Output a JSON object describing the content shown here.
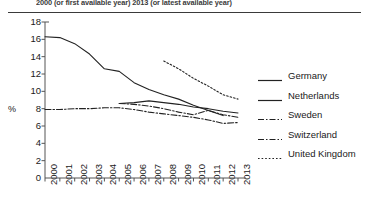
{
  "header": {
    "text": "2000 (or first available year)    2013 (or latest available year)"
  },
  "chart_data": {
    "type": "line",
    "title": "",
    "xlabel": "",
    "ylabel": "%",
    "xlim": [
      2000,
      2013
    ],
    "ylim": [
      0,
      18
    ],
    "yticks": [
      0,
      2,
      4,
      6,
      8,
      10,
      12,
      14,
      16,
      18
    ],
    "grid": false,
    "legend_position": "right",
    "categories": [
      2000,
      2001,
      2002,
      2003,
      2004,
      2005,
      2006,
      2007,
      2008,
      2009,
      2010,
      2011,
      2012,
      2013
    ],
    "series": [
      {
        "name": "Germany",
        "style": "solid",
        "color": "#222222",
        "x": [
          2000,
          2001,
          2002,
          2003,
          2004,
          2005,
          2006,
          2007,
          2008,
          2009,
          2010,
          2011,
          2012
        ],
        "values": [
          16.3,
          16.2,
          15.5,
          14.3,
          12.6,
          12.3,
          11.0,
          10.2,
          9.6,
          9.1,
          8.4,
          7.8,
          7.2
        ]
      },
      {
        "name": "Netherlands",
        "style": "solid",
        "color": "#222222",
        "x": [
          2005,
          2006,
          2007,
          2008,
          2009,
          2010,
          2011,
          2012,
          2013
        ],
        "values": [
          8.6,
          8.7,
          8.9,
          8.7,
          8.5,
          8.2,
          8.0,
          7.7,
          7.5
        ]
      },
      {
        "name": "Sweden",
        "style": "dashdot",
        "color": "#222222",
        "x": [
          2005,
          2006,
          2007,
          2008,
          2009,
          2010,
          2011,
          2012,
          2013
        ],
        "values": [
          8.6,
          8.5,
          8.3,
          8.0,
          7.6,
          7.3,
          7.8,
          7.3,
          7.0
        ]
      },
      {
        "name": "Switzerland",
        "style": "dashdot",
        "color": "#222222",
        "x": [
          2000,
          2001,
          2002,
          2003,
          2004,
          2005,
          2006,
          2007,
          2008,
          2009,
          2010,
          2011,
          2012,
          2013
        ],
        "values": [
          7.9,
          7.9,
          8.0,
          8.0,
          8.1,
          8.1,
          7.9,
          7.6,
          7.4,
          7.2,
          7.0,
          6.7,
          6.3,
          6.4
        ]
      },
      {
        "name": "United Kingdom",
        "style": "dotted",
        "color": "#222222",
        "x": [
          2008,
          2009,
          2010,
          2011,
          2012,
          2013
        ],
        "values": [
          13.5,
          12.6,
          11.5,
          10.6,
          9.6,
          9.1
        ]
      }
    ]
  },
  "legend": {
    "items": [
      {
        "label": "Germany",
        "style": "solid"
      },
      {
        "label": "Netherlands",
        "style": "solid"
      },
      {
        "label": "Sweden",
        "style": "dashdot"
      },
      {
        "label": "Switzerland",
        "style": "dashdot"
      },
      {
        "label": "United Kingdom",
        "style": "dotted"
      }
    ]
  }
}
